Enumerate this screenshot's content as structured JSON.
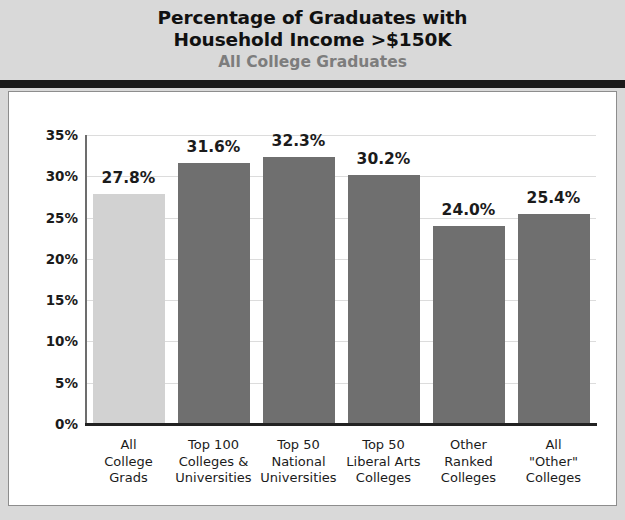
{
  "header": {
    "title_line1": "Percentage of Graduates with",
    "title_line2": "Household Income >$150K",
    "subtitle": "All College Graduates"
  },
  "chart_data": {
    "type": "bar",
    "title": "Percentage of Graduates with Household Income >$150K",
    "subtitle": "All College Graduates",
    "xlabel": "",
    "ylabel": "",
    "ylim": [
      0,
      35
    ],
    "ytick_labels": [
      "35%",
      "30%",
      "25%",
      "20%",
      "15%",
      "10%",
      "5%",
      "0%"
    ],
    "ytick_values": [
      35,
      30,
      25,
      20,
      15,
      10,
      5,
      0
    ],
    "grid": true,
    "legend": "none",
    "categories": [
      "All College Grads",
      "Top 100 Colleges & Universities",
      "Top 50 National Universities",
      "Top 50 Liberal Arts Colleges",
      "Other Ranked Colleges",
      "All \"Other\" Colleges"
    ],
    "category_lines": [
      [
        "All",
        "College",
        "Grads"
      ],
      [
        "Top 100",
        "Colleges &",
        "Universities"
      ],
      [
        "Top 50",
        "National",
        "Universities"
      ],
      [
        "Top 50",
        "Liberal Arts",
        "Colleges"
      ],
      [
        "Other",
        "Ranked",
        "Colleges"
      ],
      [
        "All",
        "\"Other\"",
        "Colleges"
      ]
    ],
    "values": [
      27.8,
      31.6,
      32.3,
      30.2,
      24.0,
      25.4
    ],
    "value_labels": [
      "27.8%",
      "31.6%",
      "32.3%",
      "30.2%",
      "24.0%",
      "25.4%"
    ],
    "bar_colors": [
      "#d2d2d2",
      "#6f6f6f",
      "#6f6f6f",
      "#6f6f6f",
      "#6f6f6f",
      "#6f6f6f"
    ]
  },
  "colors": {
    "header_background": "#d9d9d9",
    "panel_background": "#ffffff",
    "rule": "#1b1b1b",
    "gridline": "#dcdcdc",
    "highlight_bar": "#d2d2d2",
    "standard_bar": "#6f6f6f",
    "title_text": "#111111",
    "subtitle_text": "#7d7d7d"
  }
}
